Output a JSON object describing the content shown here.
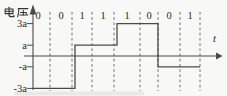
{
  "figure": {
    "y_axis_label": "电压",
    "x_axis_label": "t",
    "bit_labels": [
      "0",
      "0",
      "1",
      "1",
      "1",
      "0",
      "0",
      "1"
    ],
    "y_tick_labels": [
      "3a",
      "a",
      "-a",
      "-3a"
    ]
  },
  "chart_data": {
    "type": "line",
    "subtype": "step-waveform",
    "title": "",
    "ylabel": "电压",
    "xlabel": "t",
    "bits": [
      "0",
      "0",
      "1",
      "1",
      "1",
      "0",
      "0",
      "1"
    ],
    "y_ticks": [
      {
        "label": "3a",
        "value": 3
      },
      {
        "label": "a",
        "value": 1
      },
      {
        "label": "-a",
        "value": -1
      },
      {
        "label": "-3a",
        "value": -3
      }
    ],
    "segments": [
      {
        "bits": "00",
        "level": -3,
        "level_label": "-3a"
      },
      {
        "bits": "11",
        "level": 1,
        "level_label": "a"
      },
      {
        "bits": "10",
        "level": 3,
        "level_label": "3a"
      },
      {
        "bits": "01",
        "level": -1,
        "level_label": "-a"
      }
    ],
    "levels_sequence": [
      -3,
      1,
      3,
      -1
    ],
    "ylim": [
      -4,
      4
    ],
    "grid": "dashed-vertical-bit-boundaries",
    "legend": "none",
    "colors": {
      "line": "#4a4a4a",
      "dash": "#5f5f5f",
      "text": "#2b2b2b",
      "background": "#f8f8f6"
    },
    "layout_px": {
      "width": 227,
      "height": 96,
      "axis_x": 33,
      "axis_y": 56,
      "unit_a_px": 10.8,
      "cell_dashes_x": [
        50,
        72,
        92,
        114,
        140,
        158,
        180,
        200
      ],
      "pair_bounds_x": [
        33,
        75,
        117,
        158,
        200
      ],
      "bit_centers_x": [
        38,
        61,
        82,
        103,
        127,
        149,
        169,
        190
      ],
      "bit_label_top": 9.5,
      "x_axis_start": 24,
      "x_axis_end": 216,
      "x_arrow_tip": 222.5,
      "y_axis_top": 4.5,
      "y_axis_bottom": 90,
      "dash_top": 12,
      "dash_bottom": 91
    }
  }
}
